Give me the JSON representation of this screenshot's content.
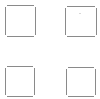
{
  "grid": {
    "stroke_color": "#8a8a8a",
    "background": "#ffffff",
    "cells": [
      {
        "id": "top-left",
        "x": 5,
        "y": 5,
        "w": 31,
        "h": 32
      },
      {
        "id": "top-right",
        "x": 65,
        "y": 6,
        "w": 32,
        "h": 31,
        "mark": true
      },
      {
        "id": "bottom-left",
        "x": 5,
        "y": 66,
        "w": 30,
        "h": 31
      },
      {
        "id": "bottom-right",
        "x": 66,
        "y": 67,
        "w": 30,
        "h": 30
      }
    ]
  }
}
